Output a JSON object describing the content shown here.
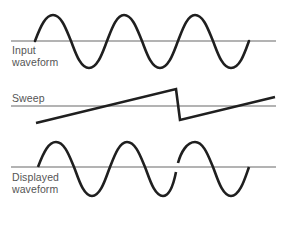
{
  "diagram": {
    "title": "",
    "colors": {
      "axis": "#9a9a9a",
      "waveform": "#1f1f1f",
      "label": "#555555",
      "background": "#ffffff"
    },
    "panels": [
      {
        "id": "input",
        "label_line1": "Input",
        "label_line2": "waveform",
        "shape": "sine",
        "axis_y": 41,
        "description": "Continuous sine wave, 3 full cycles"
      },
      {
        "id": "sweep",
        "label_line1": "Sweep",
        "shape": "sawtooth",
        "axis_y": 106,
        "description": "Rising ramp, sharp flyback, second rising ramp"
      },
      {
        "id": "displayed",
        "label_line1": "Displayed",
        "label_line2": "waveform",
        "shape": "sine-with-discontinuity",
        "axis_y": 167,
        "description": "Sine wave with a break where the sweep resets"
      }
    ]
  }
}
